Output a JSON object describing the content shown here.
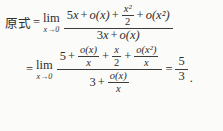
{
  "formula": {
    "line1": {
      "lhs": "原式",
      "eq": "=",
      "lim": "lim",
      "lim_sub": "x→0",
      "num": {
        "c5": "5",
        "x1": "x",
        "p1": "+",
        "ox1": "o(x)",
        "p2": "+",
        "frac_n": "x²",
        "frac_d": "2",
        "p3": "+",
        "ox2": "o(x²)"
      },
      "den": {
        "c3": "3",
        "x": "x",
        "p": "+",
        "ox": "o(x)"
      }
    },
    "line2": {
      "eq": "=",
      "lim": "lim",
      "lim_sub": "x→0",
      "num": {
        "c5": "5",
        "p1": "+",
        "f1n": "o(x)",
        "f1d": "x",
        "p2": "+",
        "f2n": "x",
        "f2d": "2",
        "p3": "+",
        "f3n": "o(x²)",
        "f3d": "x"
      },
      "den": {
        "c3": "3",
        "p": "+",
        "f4n": "o(x)",
        "f4d": "x"
      },
      "result_eq": "=",
      "result_num": "5",
      "result_den": "3",
      "period": "."
    }
  }
}
